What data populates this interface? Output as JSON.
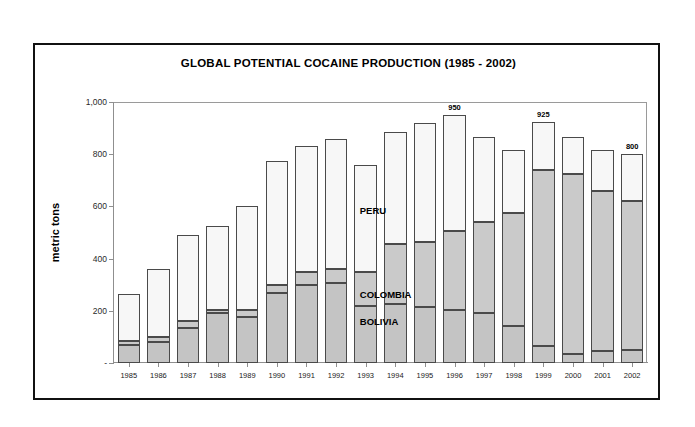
{
  "figure": {
    "title": "GLOBAL POTENTIAL COCAINE PRODUCTION (1985 - 2002)",
    "y_axis_title": "metric tons"
  },
  "series_labels": {
    "peru": "PERU",
    "colombia": "COLOMBIA",
    "bolivia": "BOLIVIA"
  },
  "chart_data": {
    "type": "bar",
    "title": "GLOBAL POTENTIAL COCAINE PRODUCTION (1985 - 2002)",
    "subtitle": "",
    "xlabel": "",
    "ylabel": "metric tons",
    "stacked": true,
    "grid": false,
    "legend_position": "in-plot annotations",
    "ylim": [
      0,
      1000
    ],
    "ytick_labels": [
      "1,000",
      "800",
      "600",
      "400",
      "200",
      "-"
    ],
    "ytick_values": [
      1000,
      800,
      600,
      400,
      200,
      0
    ],
    "categories": [
      "1985",
      "1986",
      "1987",
      "1988",
      "1989",
      "1990",
      "1991",
      "1992",
      "1993",
      "1994",
      "1995",
      "1996",
      "1997",
      "1998",
      "1999",
      "2000",
      "2001",
      "2002"
    ],
    "series": [
      {
        "name": "BOLIVIA",
        "color": "#c4c4c4",
        "values": [
          70,
          80,
          135,
          190,
          175,
          270,
          300,
          305,
          220,
          225,
          215,
          205,
          190,
          140,
          65,
          35,
          45,
          50
        ]
      },
      {
        "name": "COLOMBIA",
        "color": "#cacaca",
        "values": [
          15,
          20,
          25,
          15,
          30,
          30,
          50,
          55,
          130,
          230,
          250,
          300,
          350,
          435,
          675,
          690,
          615,
          570
        ]
      },
      {
        "name": "PERU",
        "color": "#f7f7f7",
        "values": [
          180,
          260,
          330,
          320,
          395,
          475,
          480,
          500,
          410,
          430,
          455,
          445,
          325,
          240,
          185,
          140,
          155,
          180
        ]
      }
    ],
    "totals": [
      265,
      360,
      490,
      525,
      600,
      775,
      830,
      860,
      760,
      885,
      920,
      950,
      865,
      815,
      925,
      865,
      815,
      800
    ],
    "annotated_values": [
      {
        "category": "1996",
        "value": 950,
        "label": "950"
      },
      {
        "category": "1999",
        "value": 925,
        "label": "925"
      },
      {
        "category": "2002",
        "value": 800,
        "label": "800"
      }
    ]
  }
}
